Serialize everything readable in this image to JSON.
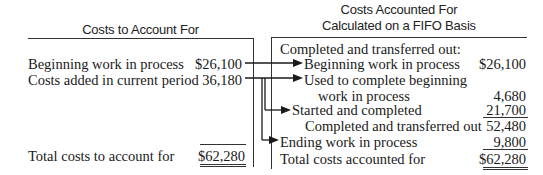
{
  "left": {
    "header": "Costs to Account For",
    "rows": [
      {
        "label": "Beginning work in process",
        "value": "$26,100"
      },
      {
        "label": "Costs added in current period",
        "value": "36,180"
      }
    ],
    "total": {
      "label": "Total costs to account for",
      "value": "$62,280"
    }
  },
  "right": {
    "header_line1": "Costs Accounted For",
    "header_line2": "Calculated on a FIFO Basis",
    "section_label": "Completed and transferred out:",
    "rows": [
      {
        "label": "Beginning work in process",
        "value": "$26,100"
      },
      {
        "label": "Used to complete beginning",
        "value": ""
      },
      {
        "label": "work in process",
        "value": "4,680"
      },
      {
        "label": "Started and completed",
        "value": "21,700"
      },
      {
        "label": "Completed and transferred out",
        "value": "52,480"
      },
      {
        "label": "Ending work in process",
        "value": "9,800"
      }
    ],
    "total": {
      "label": "Total costs accounted for",
      "value": "$62,280"
    }
  },
  "colors": {
    "ink": "#1a1a1a",
    "rule": "#333333"
  }
}
